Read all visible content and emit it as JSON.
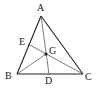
{
  "diagram": {
    "type": "triangle-geometry",
    "points": {
      "A": {
        "label": "A"
      },
      "B": {
        "label": "B"
      },
      "C": {
        "label": "C"
      },
      "D": {
        "label": "D"
      },
      "E": {
        "label": "E"
      },
      "G": {
        "label": "G"
      }
    },
    "segments": [
      [
        "A",
        "B"
      ],
      [
        "B",
        "C"
      ],
      [
        "C",
        "A"
      ],
      [
        "A",
        "D"
      ],
      [
        "C",
        "E"
      ],
      [
        "B",
        "G"
      ]
    ],
    "relations": [
      "D on BC",
      "E on AB",
      "G = intersection of AD and CE"
    ],
    "colors": {
      "stroke": "#222222",
      "background": "#ffffff"
    }
  }
}
